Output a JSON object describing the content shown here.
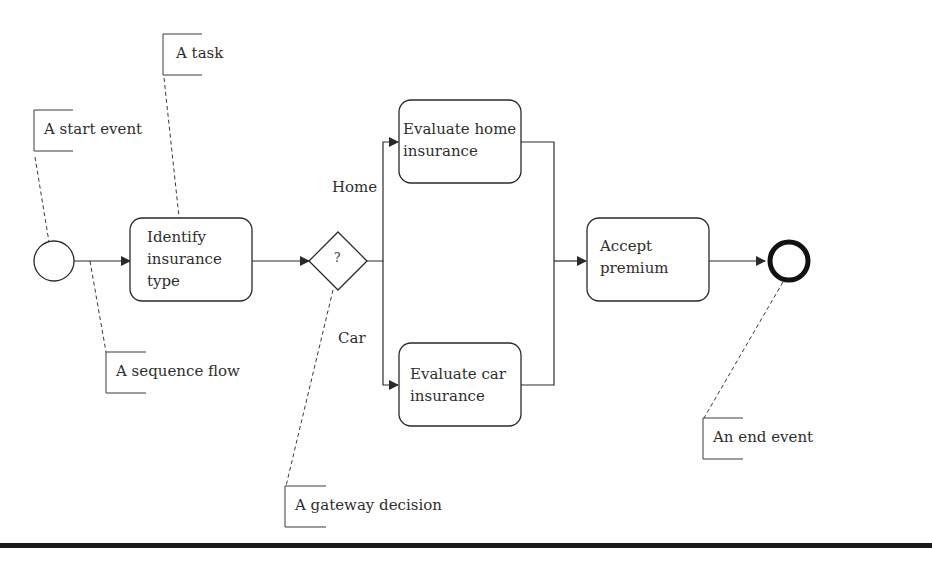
{
  "diagram": {
    "type": "BPMN process",
    "annotations": {
      "start_event": "A start event",
      "task": "A task",
      "sequence_flow": "A sequence flow",
      "gateway_decision": "A gateway decision",
      "end_event": "An end event"
    },
    "tasks": {
      "identify": [
        "Identify",
        "insurance",
        "type"
      ],
      "eval_home": [
        "Evaluate home",
        "insurance"
      ],
      "eval_car": [
        "Evaluate car",
        "insurance"
      ],
      "accept": [
        "Accept",
        "premium"
      ]
    },
    "gateway": {
      "symbol": "?"
    },
    "branch_labels": {
      "home": "Home",
      "car": "Car"
    },
    "colors": {
      "stroke": "#2a2a2a",
      "background": "#ffffff",
      "bar": "#1a1a1a"
    }
  }
}
